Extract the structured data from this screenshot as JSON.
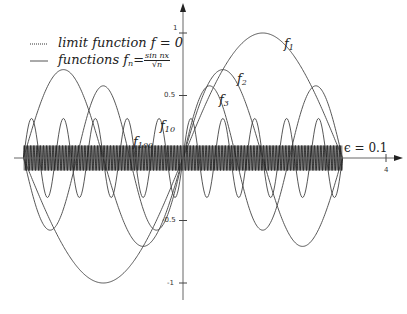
{
  "chart_data": {
    "type": "line",
    "title": "",
    "xlabel": "",
    "ylabel": "",
    "xlim": [
      -3.14159,
      4
    ],
    "ylim": [
      -1,
      1
    ],
    "x_ticks": [
      "4"
    ],
    "y_ticks": [
      "1",
      "0.5",
      "-0.5",
      "-1"
    ],
    "domain": [
      -3.14159,
      3.14159
    ],
    "formula": "f_n(x) = sin(n x) / sqrt(n)",
    "series": [
      {
        "name": "f_1",
        "n": 1,
        "amplitude": 1.0
      },
      {
        "name": "f_2",
        "n": 2,
        "amplitude": 0.707
      },
      {
        "name": "f_3",
        "n": 3,
        "amplitude": 0.577
      },
      {
        "name": "f_10",
        "n": 10,
        "amplitude": 0.316
      },
      {
        "name": "f_100",
        "n": 100,
        "amplitude": 0.1
      }
    ],
    "limit_function": {
      "name": "f",
      "value": 0
    },
    "epsilon_band": {
      "label": "ε = 0.1",
      "value": 0.1
    },
    "legend": [
      {
        "style": "dotted",
        "label": "limit function f = 0"
      },
      {
        "style": "solid",
        "label": "functions f_n = sin(nx)/√n"
      }
    ],
    "grid": false,
    "legend_position": "upper-left"
  },
  "legend": {
    "limit_text": "limit function f = 0",
    "functions_text": "functions f",
    "functions_sub": "n",
    "eq": "=",
    "frac_num": "sin nx",
    "frac_den": "√n"
  },
  "labels": {
    "f1": "f",
    "f1_sub": "1",
    "f2": "f",
    "f2_sub": "2",
    "f3": "f",
    "f3_sub": "3",
    "f10": "f",
    "f10_sub": "10",
    "f100": "f",
    "f100_sub": "100",
    "epsilon": "ϵ = 0.1"
  },
  "ticks": {
    "y1": "1",
    "y05": "0.5",
    "ym05": "-0.5",
    "ym1": "-1",
    "x4": "4"
  }
}
